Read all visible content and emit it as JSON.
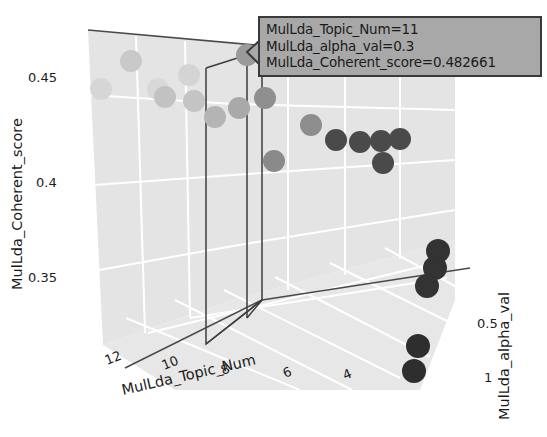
{
  "chart_data": {
    "type": "scatter",
    "title": "",
    "xlabel": "MulLda_Topic_Num",
    "ylabel": "MulLda_Coherent_score",
    "zlabel": "MulLda_alpha_val",
    "x_ticks": [
      "12",
      "10",
      "8",
      "6",
      "4"
    ],
    "y_ticks": [
      "0.45",
      "0.4",
      "0.35"
    ],
    "z_ticks": [
      "0.5",
      "1"
    ],
    "xlim": [
      13,
      3
    ],
    "ylim": [
      0.325,
      0.47
    ],
    "zlim": [
      0.05,
      1.05
    ],
    "grid": true,
    "legend": "none",
    "projection": "3d",
    "series": [
      {
        "name": "MulLda coherence scatter",
        "points": [
          {
            "topic_num": 12,
            "alpha_val": 0.1,
            "coherent_score": 0.452,
            "px": 101,
            "py": 89,
            "shade": "#d6d6d6",
            "r": 11
          },
          {
            "topic_num": 11,
            "alpha_val": 0.1,
            "coherent_score": 0.458,
            "px": 131,
            "py": 61,
            "shade": "#c9c9c9",
            "r": 11
          },
          {
            "topic_num": 10,
            "alpha_val": 0.1,
            "coherent_score": 0.45,
            "px": 158,
            "py": 89,
            "shade": "#d8d8d8",
            "r": 11
          },
          {
            "topic_num": 9,
            "alpha_val": 0.1,
            "coherent_score": 0.452,
            "px": 189,
            "py": 75,
            "shade": "#d4d4d4",
            "r": 11
          },
          {
            "topic_num": 9,
            "alpha_val": 0.2,
            "coherent_score": 0.447,
            "px": 194,
            "py": 101,
            "shade": "#c4c4c4",
            "r": 11
          },
          {
            "topic_num": 8,
            "alpha_val": 0.2,
            "coherent_score": 0.441,
            "px": 215,
            "py": 117,
            "shade": "#b4b4b4",
            "r": 11
          },
          {
            "topic_num": 10,
            "alpha_val": 0.2,
            "coherent_score": 0.444,
            "px": 165,
            "py": 97,
            "shade": "#c2c2c2",
            "r": 11
          },
          {
            "topic_num": 8,
            "alpha_val": 0.25,
            "coherent_score": 0.444,
            "px": 239,
            "py": 108,
            "shade": "#a9a9a9",
            "r": 11
          },
          {
            "topic_num": 11,
            "alpha_val": 0.3,
            "coherent_score": 0.482661,
            "px": 247,
            "py": 55,
            "shade": "#9a9a9a",
            "r": 11
          },
          {
            "topic_num": 7,
            "alpha_val": 0.3,
            "coherent_score": 0.438,
            "px": 265,
            "py": 98,
            "shade": "#8f8f8f",
            "r": 11
          },
          {
            "topic_num": 7,
            "alpha_val": 0.3,
            "coherent_score": 0.418,
            "px": 274,
            "py": 161,
            "shade": "#8a8a8a",
            "r": 11
          },
          {
            "topic_num": 6,
            "alpha_val": 0.35,
            "coherent_score": 0.437,
            "px": 311,
            "py": 125,
            "shade": "#8d8d8d",
            "r": 11
          },
          {
            "topic_num": 6,
            "alpha_val": 0.4,
            "coherent_score": 0.43,
            "px": 336,
            "py": 140,
            "shade": "#4a4a4a",
            "r": 11
          },
          {
            "topic_num": 5,
            "alpha_val": 0.4,
            "coherent_score": 0.429,
            "px": 360,
            "py": 142,
            "shade": "#4a4a4a",
            "r": 11
          },
          {
            "topic_num": 5,
            "alpha_val": 0.45,
            "coherent_score": 0.429,
            "px": 381,
            "py": 141,
            "shade": "#4a4a4a",
            "r": 11
          },
          {
            "topic_num": 4,
            "alpha_val": 0.45,
            "coherent_score": 0.429,
            "px": 400,
            "py": 139,
            "shade": "#4a4a4a",
            "r": 11
          },
          {
            "topic_num": 5,
            "alpha_val": 0.5,
            "coherent_score": 0.418,
            "px": 383,
            "py": 163,
            "shade": "#4a4a4a",
            "r": 11
          },
          {
            "topic_num": 4,
            "alpha_val": 0.8,
            "coherent_score": 0.372,
            "px": 438,
            "py": 251,
            "shade": "#333333",
            "r": 12
          },
          {
            "topic_num": 4,
            "alpha_val": 0.85,
            "coherent_score": 0.366,
            "px": 435,
            "py": 268,
            "shade": "#333333",
            "r": 12
          },
          {
            "topic_num": 4,
            "alpha_val": 0.9,
            "coherent_score": 0.36,
            "px": 427,
            "py": 286,
            "shade": "#333333",
            "r": 12
          },
          {
            "topic_num": 4,
            "alpha_val": 0.95,
            "coherent_score": 0.34,
            "px": 418,
            "py": 346,
            "shade": "#2e2e2e",
            "r": 12
          },
          {
            "topic_num": 4,
            "alpha_val": 1.0,
            "coherent_score": 0.333,
            "px": 414,
            "py": 371,
            "shade": "#2e2e2e",
            "r": 12
          }
        ]
      }
    ]
  },
  "axes": {
    "x": {
      "label": "MulLda_Topic_Num",
      "ticks": [
        "12",
        "10",
        "8",
        "6",
        "4"
      ]
    },
    "y": {
      "label": "MulLda_Coherent_score",
      "ticks": [
        "0.45",
        "0.4",
        "0.35"
      ]
    },
    "z": {
      "label": "MulLda_alpha_val",
      "ticks": [
        "0.5",
        "1"
      ]
    }
  },
  "tooltip": {
    "line1": "MulLda_Topic_Num=11",
    "line2": "MulLda_alpha_val=0.3",
    "line3": "MulLda_Coherent_score=0.482661",
    "bg_color": "#a8a8a8",
    "border_color": "#3a3a3a"
  },
  "colors": {
    "panel": "#e3e3e3",
    "floor": "#e6e6e6",
    "gridline": "#ffffff",
    "axis_line": "#4a4a4a",
    "selection_line": "#3d3d3d"
  }
}
